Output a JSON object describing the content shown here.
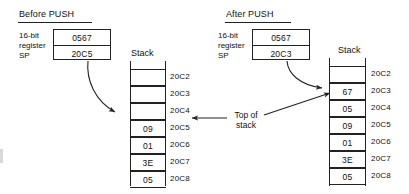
{
  "figure": {
    "ink_color": "#222222",
    "background": "#ffffff"
  },
  "panels": [
    {
      "id": "before",
      "heading": "Before PUSH",
      "register": {
        "label_lines": [
          "16-bit",
          "register",
          "SP"
        ],
        "top_value": "0567",
        "bottom_value": "20C5"
      },
      "stack": {
        "title": "Stack",
        "rows": [
          {
            "address": "20C2",
            "value": ""
          },
          {
            "address": "20C3",
            "value": ""
          },
          {
            "address": "20C4",
            "value": ""
          },
          {
            "address": "20C5",
            "value": "09"
          },
          {
            "address": "20C6",
            "value": "01"
          },
          {
            "address": "20C7",
            "value": "3E"
          },
          {
            "address": "20C8",
            "value": "05"
          }
        ],
        "top_of_stack_address": "20C5"
      }
    },
    {
      "id": "after",
      "heading": "After PUSH",
      "register": {
        "label_lines": [
          "16-bit",
          "register",
          "SP"
        ],
        "top_value": "0567",
        "bottom_value": "20C3"
      },
      "stack": {
        "title": "Stack",
        "rows": [
          {
            "address": "20C2",
            "value": ""
          },
          {
            "address": "20C3",
            "value": "67"
          },
          {
            "address": "20C4",
            "value": "05"
          },
          {
            "address": "20C5",
            "value": "09"
          },
          {
            "address": "20C6",
            "value": "01"
          },
          {
            "address": "20C7",
            "value": "3E"
          },
          {
            "address": "20C8",
            "value": "05"
          }
        ],
        "top_of_stack_address": "20C3"
      }
    }
  ],
  "annotation": {
    "top_of_stack_line1": "Top of",
    "top_of_stack_line2": "stack"
  }
}
